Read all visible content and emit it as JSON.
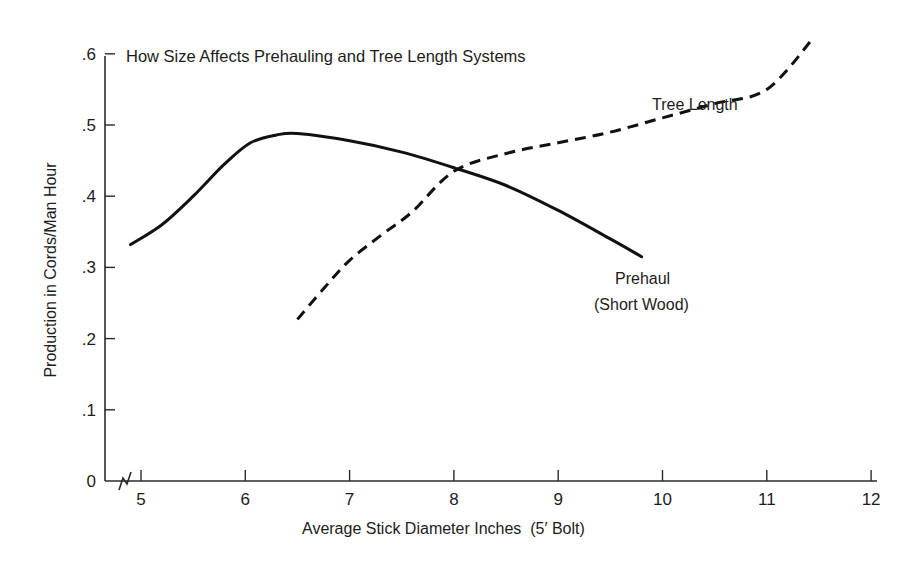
{
  "chart_data": {
    "type": "line",
    "title": "How Size Affects Prehauling and Tree Length Systems",
    "xlabel": "Average Stick Diameter Inches  (5′ Bolt)",
    "ylabel": "Production in Cords/Man Hour",
    "xlim": [
      5,
      12
    ],
    "ylim": [
      0,
      0.6
    ],
    "x_axis_break": true,
    "grid": false,
    "legend": "inline curve labels",
    "x_ticks": [
      5,
      6,
      7,
      8,
      9,
      10,
      11,
      12
    ],
    "x_tick_labels": [
      "5",
      "6",
      "7",
      "8",
      "9",
      "10",
      "11",
      "12"
    ],
    "y_ticks": [
      0,
      0.1,
      0.2,
      0.3,
      0.4,
      0.5,
      0.6
    ],
    "y_tick_labels": [
      "0",
      ".1",
      ".2",
      ".3",
      ".4",
      ".5",
      ".6"
    ],
    "series": [
      {
        "name": "Prehaul (Short Wood)",
        "style": "solid",
        "x": [
          4.9,
          5.2,
          5.5,
          5.8,
          6.05,
          6.3,
          6.5,
          7.0,
          7.5,
          8.0,
          8.5,
          9.0,
          9.5,
          9.8
        ],
        "values": [
          0.332,
          0.36,
          0.4,
          0.445,
          0.475,
          0.486,
          0.488,
          0.478,
          0.462,
          0.44,
          0.415,
          0.38,
          0.34,
          0.315
        ],
        "label_lines": [
          "Prehaul",
          "(Short Wood)"
        ]
      },
      {
        "name": "Tree Length",
        "style": "dashed",
        "x": [
          6.5,
          6.75,
          7.0,
          7.3,
          7.6,
          8.0,
          8.5,
          9.0,
          9.5,
          10.0,
          10.5,
          11.0,
          11.45
        ],
        "values": [
          0.227,
          0.27,
          0.31,
          0.345,
          0.378,
          0.435,
          0.46,
          0.475,
          0.49,
          0.51,
          0.53,
          0.55,
          0.623
        ],
        "label_lines": [
          "Tree Length"
        ]
      }
    ],
    "annotations": [
      {
        "text": "Tree Length",
        "near_x": 10.2,
        "near_y": 0.52
      },
      {
        "text": "Prehaul",
        "near_x": 10.0,
        "near_y": 0.28
      },
      {
        "text": "(Short Wood)",
        "near_x": 10.0,
        "near_y": 0.24
      }
    ]
  },
  "labels": {
    "title": "How Size Affects Prehauling and Tree Length Systems",
    "xlabel": "Average Stick Diameter Inches  (5′ Bolt)",
    "ylabel": "Production in Cords/Man Hour",
    "tree_length": "Tree Length",
    "prehaul_line1": "Prehaul",
    "prehaul_line2": "(Short Wood)"
  }
}
